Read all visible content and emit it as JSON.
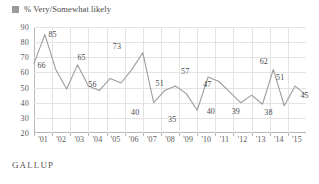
{
  "legend": {
    "label": "% Very/Somewhat likely",
    "swatch_color": "#9a9a9a",
    "icon": "legend-square-icon"
  },
  "footer": {
    "brand": "GALLUP"
  },
  "chart_data": {
    "type": "line",
    "title": "",
    "subtitle": "",
    "xlabel": "",
    "ylabel": "",
    "ylim": [
      20,
      90
    ],
    "yticks": [
      20,
      30,
      40,
      50,
      60,
      70,
      80,
      90
    ],
    "grid": true,
    "legend_position": "top-left",
    "series": [
      {
        "name": "% Very/Somewhat likely",
        "color": "#9d9d9d",
        "x": [
          "'01",
          "'01",
          "'02",
          "'02",
          "'02",
          "'02",
          "'03",
          "'03",
          "'03",
          "'04",
          "'04",
          "'05",
          "'05",
          "'06",
          "'06",
          "'07",
          "'07",
          "'08",
          "'09",
          "'10",
          "'11",
          "'11",
          "'12",
          "'13",
          "'14",
          "'15"
        ],
        "values": [
          66,
          85,
          62,
          49,
          65,
          51,
          48,
          56,
          53,
          62,
          73,
          40,
          48,
          51,
          46,
          35,
          57,
          54,
          47,
          40,
          45,
          39,
          62,
          38,
          51,
          45
        ]
      }
    ],
    "categories": [
      "'01",
      "'02",
      "'03",
      "'04",
      "'05",
      "'06",
      "'07",
      "'08",
      "'09",
      "'10",
      "'11",
      "'12",
      "'13",
      "'14",
      "'15"
    ],
    "point_labels": [
      {
        "text": "85",
        "value": 85,
        "x_frac": 0.068,
        "y_px": 7
      },
      {
        "text": "66",
        "value": 66,
        "x_frac": 0.028,
        "y_px": 38
      },
      {
        "text": "65",
        "value": 65,
        "x_frac": 0.175,
        "y_px": 30
      },
      {
        "text": "73",
        "value": 73,
        "x_frac": 0.305,
        "y_px": 19
      },
      {
        "text": "56",
        "value": 56,
        "x_frac": 0.215,
        "y_px": 57
      },
      {
        "text": "40",
        "value": 40,
        "x_frac": 0.372,
        "y_px": 85
      },
      {
        "text": "51",
        "value": 51,
        "x_frac": 0.462,
        "y_px": 56
      },
      {
        "text": "57",
        "value": 57,
        "x_frac": 0.556,
        "y_px": 44
      },
      {
        "text": "35",
        "value": 35,
        "x_frac": 0.508,
        "y_px": 92
      },
      {
        "text": "47",
        "value": 47,
        "x_frac": 0.637,
        "y_px": 57
      },
      {
        "text": "40",
        "value": 40,
        "x_frac": 0.65,
        "y_px": 84
      },
      {
        "text": "39",
        "value": 39,
        "x_frac": 0.742,
        "y_px": 84
      },
      {
        "text": "62",
        "value": 62,
        "x_frac": 0.845,
        "y_px": 34
      },
      {
        "text": "38",
        "value": 38,
        "x_frac": 0.862,
        "y_px": 85
      },
      {
        "text": "51",
        "value": 51,
        "x_frac": 0.905,
        "y_px": 50
      },
      {
        "text": "45",
        "value": 45,
        "x_frac": 0.995,
        "y_px": 68
      }
    ]
  }
}
